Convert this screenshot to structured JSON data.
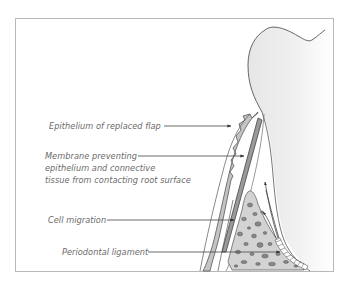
{
  "diagram": {
    "type": "anatomical-illustration",
    "labels": [
      {
        "id": "epithelium",
        "text": "Epithelium of replaced flap"
      },
      {
        "id": "membrane_line1",
        "text": "Membrane preventing"
      },
      {
        "id": "membrane_line2",
        "text": "epithelium and connective"
      },
      {
        "id": "membrane_line3",
        "text": "tissue from contacting root surface"
      },
      {
        "id": "cell_migration",
        "text": "Cell migration"
      },
      {
        "id": "periodontal_ligament",
        "text": "Periodontal ligament"
      }
    ],
    "colors": {
      "frame": "#b8b8b8",
      "outline": "#555555",
      "tissue_fill": "#c4c4c4",
      "membrane_fill": "#9a9a9a",
      "bone_fill": "#d0d0d0",
      "label_text": "#6a6a6a",
      "leader_line": "#444444"
    }
  }
}
